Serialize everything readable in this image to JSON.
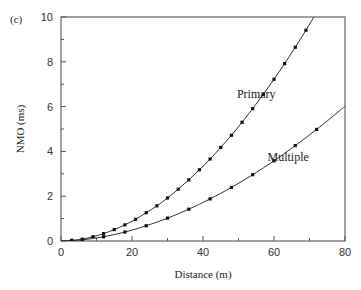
{
  "panel_label": "(c)",
  "chart_data": {
    "type": "line",
    "title": "",
    "xlabel": "Distance (m)",
    "ylabel": "NMO (ms)",
    "xlim": [
      0,
      80
    ],
    "ylim": [
      0,
      10
    ],
    "x_ticks": [
      0,
      20,
      40,
      60,
      80
    ],
    "y_ticks": [
      0,
      2,
      4,
      6,
      8,
      10
    ],
    "x_minor_step": 10,
    "y_minor_step": 1,
    "grid": false,
    "legend": "inline labels",
    "series": [
      {
        "name": "Primary",
        "label_pos": [
          55,
          6.4
        ],
        "x": [
          3,
          6,
          9,
          12,
          15,
          18,
          21,
          24,
          27,
          30,
          33,
          36,
          39,
          42,
          45,
          48,
          51,
          54,
          57,
          60,
          63,
          66,
          69,
          72,
          75
        ],
        "values": [
          0.03,
          0.08,
          0.19,
          0.33,
          0.51,
          0.72,
          0.97,
          1.26,
          1.57,
          1.92,
          2.31,
          2.73,
          3.18,
          3.66,
          4.18,
          4.72,
          5.3,
          5.91,
          6.55,
          7.22,
          7.92,
          8.65,
          9.41,
          10.2,
          11.0
        ],
        "markers": [
          3,
          6,
          9,
          12,
          15,
          18,
          21,
          24,
          27,
          30,
          33,
          36,
          39,
          42,
          45,
          48,
          51,
          54,
          57,
          60,
          63,
          66,
          69,
          72
        ],
        "color": "#333333"
      },
      {
        "name": "Multiple",
        "label_pos": [
          64,
          3.55
        ],
        "x": [
          3,
          6,
          12,
          18,
          24,
          30,
          36,
          42,
          48,
          54,
          60,
          66,
          72,
          78,
          80
        ],
        "values": [
          0.02,
          0.05,
          0.19,
          0.4,
          0.68,
          1.02,
          1.42,
          1.88,
          2.39,
          2.96,
          3.58,
          4.26,
          4.98,
          5.75,
          6.02
        ],
        "markers": [
          3,
          6,
          12,
          18,
          24,
          30,
          36,
          42,
          48,
          54,
          60,
          66,
          72
        ],
        "color": "#333333"
      }
    ]
  }
}
